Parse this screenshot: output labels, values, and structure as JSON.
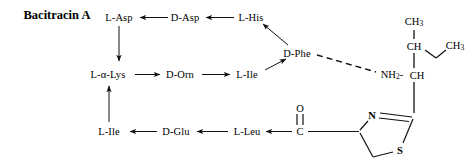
{
  "title": {
    "text": "Bacitracin A",
    "x": 57,
    "y": 15
  },
  "colors": {
    "ink": "#000000",
    "background": "#ffffff"
  },
  "residues": [
    {
      "id": "l-asp",
      "label": "L-Asp",
      "x": 119,
      "y": 17
    },
    {
      "id": "d-asp",
      "label": "D-Asp",
      "x": 185,
      "y": 17
    },
    {
      "id": "l-his",
      "label": "L-His",
      "x": 251,
      "y": 17
    },
    {
      "id": "d-phe",
      "label": "D-Phe",
      "x": 297,
      "y": 53
    },
    {
      "id": "l-a-lys",
      "label": "L-α-Lys",
      "x": 108,
      "y": 74
    },
    {
      "id": "d-orn",
      "label": "D-Orn",
      "x": 180,
      "y": 74
    },
    {
      "id": "l-ile-2",
      "label": "L-Ile",
      "x": 247,
      "y": 74
    },
    {
      "id": "l-ile-1",
      "label": "L-Ile",
      "x": 109,
      "y": 131
    },
    {
      "id": "d-glu",
      "label": "D-Glu",
      "x": 176,
      "y": 131
    },
    {
      "id": "l-leu",
      "label": "L-Leu",
      "x": 247,
      "y": 131
    }
  ],
  "atoms": [
    {
      "id": "ch3-top",
      "label": "CH3",
      "html": "CH<sub>3</sub>",
      "x": 414,
      "y": 22
    },
    {
      "id": "ch-beta",
      "label": "CH",
      "html": "CH",
      "x": 414,
      "y": 46
    },
    {
      "id": "ch3-right",
      "label": "CH3",
      "html": "CH<sub>3</sub>",
      "x": 455,
      "y": 46
    },
    {
      "id": "nh2",
      "label": "NH2-",
      "html": "NH<sub>2</sub>-",
      "x": 392,
      "y": 75
    },
    {
      "id": "ch-alpha",
      "label": "CH",
      "html": "CH",
      "x": 417,
      "y": 75
    },
    {
      "id": "oxygen",
      "label": "O",
      "html": "O",
      "x": 300,
      "y": 108
    },
    {
      "id": "carbonyl-c",
      "label": "C",
      "html": "C",
      "x": 300,
      "y": 131
    },
    {
      "id": "nitrogen",
      "label": "N",
      "html": "N",
      "x": 372,
      "y": 115
    },
    {
      "id": "sulfur",
      "label": "S",
      "html": "S",
      "x": 400,
      "y": 150
    }
  ],
  "bonds": {
    "arrows": [
      {
        "id": "d-asp-to-l-asp",
        "from": "D-Asp",
        "to": "L-Asp",
        "style": "solid-arrow"
      },
      {
        "id": "l-his-to-d-asp",
        "from": "L-His",
        "to": "D-Asp",
        "style": "solid-arrow"
      },
      {
        "id": "l-asp-to-l-a-lys",
        "from": "L-Asp",
        "to": "L-α-Lys",
        "style": "solid-arrow"
      },
      {
        "id": "l-a-lys-to-d-orn",
        "from": "L-α-Lys",
        "to": "D-Orn",
        "style": "solid-arrow"
      },
      {
        "id": "d-orn-to-l-ile",
        "from": "D-Orn",
        "to": "L-Ile",
        "style": "solid-arrow"
      },
      {
        "id": "l-ile-to-d-phe",
        "from": "L-Ile",
        "to": "D-Phe",
        "style": "solid-arrow"
      },
      {
        "id": "d-phe-to-l-his",
        "from": "D-Phe",
        "to": "L-His",
        "style": "solid-arrow"
      },
      {
        "id": "l-ile-to-l-a-lys",
        "from": "L-Ile",
        "to": "L-α-Lys",
        "style": "solid-arrow"
      },
      {
        "id": "d-glu-to-l-ile",
        "from": "D-Glu",
        "to": "L-Ile",
        "style": "solid-arrow"
      },
      {
        "id": "l-leu-to-d-glu",
        "from": "L-Leu",
        "to": "D-Glu",
        "style": "solid-arrow"
      },
      {
        "id": "carbonyl-to-l-leu",
        "from": "C",
        "to": "L-Leu",
        "style": "solid-arrow"
      }
    ],
    "dashed": [
      {
        "id": "d-phe-to-nh2",
        "from": "D-Phe",
        "to": "NH2",
        "style": "dashed-line"
      }
    ],
    "plain": [
      {
        "id": "ch3-ch-bond",
        "from": "CH3",
        "to": "CH",
        "style": "single"
      },
      {
        "id": "ch-ethyl-bond",
        "from": "CH",
        "to": "CH3",
        "style": "single"
      },
      {
        "id": "ch-beta-ch-alpha",
        "from": "CH",
        "to": "CH",
        "style": "single"
      },
      {
        "id": "ch-alpha-ring-bond",
        "from": "CH",
        "to": "C2",
        "style": "single"
      },
      {
        "id": "carbonyl-double",
        "from": "C",
        "to": "O",
        "style": "double"
      },
      {
        "id": "c-to-ring-c4",
        "from": "C",
        "to": "C4",
        "style": "single"
      },
      {
        "id": "ring-n-c2",
        "from": "N",
        "to": "C2",
        "style": "double"
      },
      {
        "id": "ring-c4-n",
        "from": "C4",
        "to": "N",
        "style": "single"
      },
      {
        "id": "ring-c4-c5",
        "from": "C4",
        "to": "C5",
        "style": "single"
      },
      {
        "id": "ring-c5-s",
        "from": "C5",
        "to": "S",
        "style": "single"
      },
      {
        "id": "ring-s-c2",
        "from": "S",
        "to": "C2",
        "style": "single"
      }
    ]
  }
}
